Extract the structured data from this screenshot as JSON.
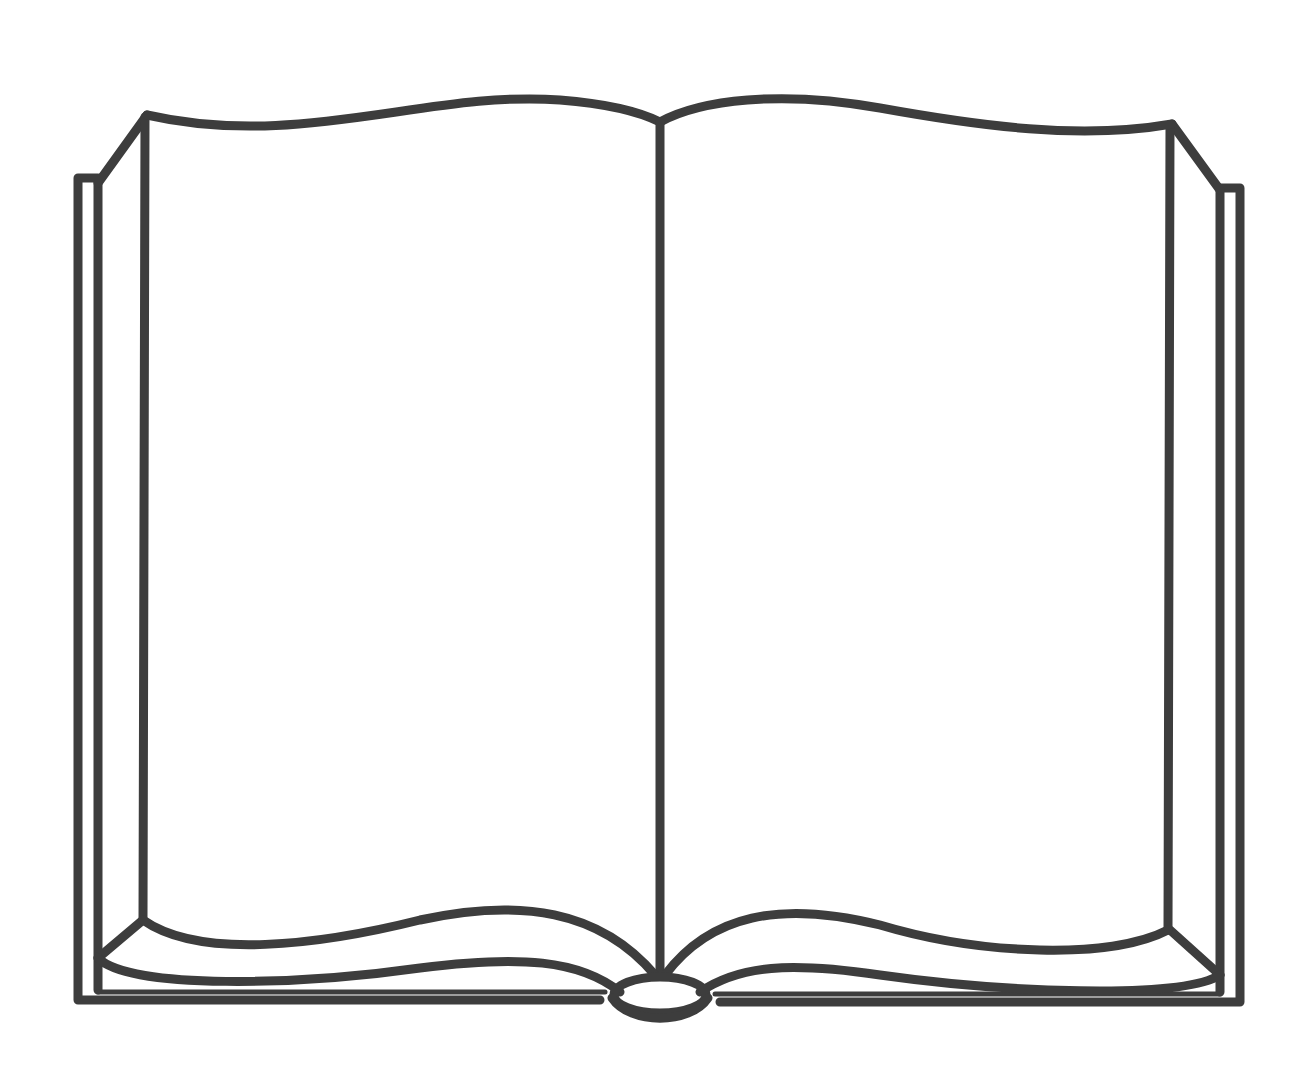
{
  "illustration": {
    "subject": "open-book",
    "style": "line-art",
    "stroke_color": "#3d3d3d",
    "background_color": "#ffffff",
    "stroke_width": 9
  }
}
